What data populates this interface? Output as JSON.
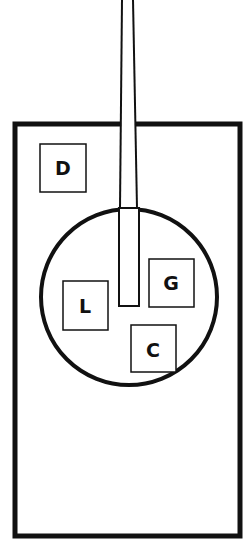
{
  "diagram": {
    "colors": {
      "stroke": "#111111",
      "background": "#ffffff"
    },
    "boxes": [
      {
        "id": "D",
        "label": "D"
      },
      {
        "id": "G",
        "label": "G"
      },
      {
        "id": "L",
        "label": "L"
      },
      {
        "id": "C",
        "label": "C"
      }
    ]
  }
}
